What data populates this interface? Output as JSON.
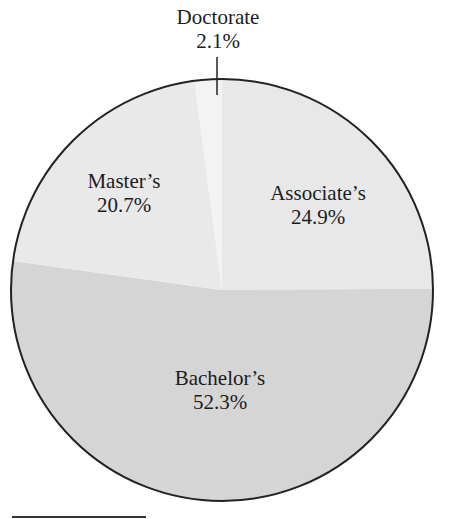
{
  "chart_data": {
    "type": "pie",
    "title": "",
    "start_angle_deg": -7.56,
    "direction": "clockwise",
    "categories": [
      "Doctorate",
      "Associate's",
      "Bachelor's",
      "Master's"
    ],
    "values": [
      2.1,
      24.9,
      52.3,
      20.7
    ],
    "unit": "%",
    "slices": [
      {
        "label": "Doctorate",
        "value": 2.1,
        "value_label": "2.1%",
        "color": "#f3f3f3",
        "label_position": "outside-top-with-leader"
      },
      {
        "label": "Associate’s",
        "value": 24.9,
        "value_label": "24.9%",
        "color": "#e8e8e8",
        "label_position": "inside"
      },
      {
        "label": "Bachelor’s",
        "value": 52.3,
        "value_label": "52.3%",
        "color": "#d5d5d5",
        "label_position": "inside"
      },
      {
        "label": "Master’s",
        "value": 20.7,
        "value_label": "20.7%",
        "color": "#e9e9e9",
        "label_position": "inside"
      }
    ],
    "legend": "none",
    "outline_color": "#222222"
  },
  "labels": {
    "doctorate_name": "Doctorate",
    "doctorate_pct": "2.1%",
    "associates_name": "Associate’s",
    "associates_pct": "24.9%",
    "bachelors_name": "Bachelor’s",
    "bachelors_pct": "52.3%",
    "masters_name": "Master’s",
    "masters_pct": "20.7%"
  }
}
